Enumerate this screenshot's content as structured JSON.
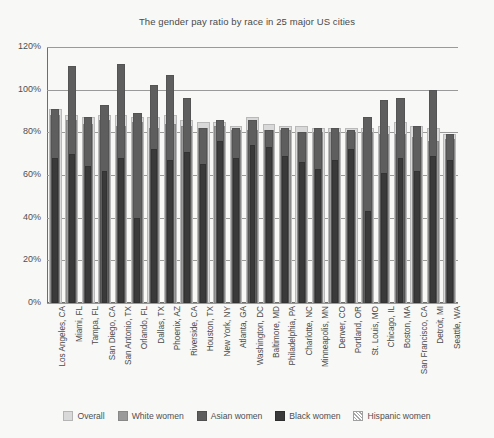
{
  "chart_data": {
    "type": "bar",
    "title": "The gender pay ratio by race in 25 major US cities",
    "xlabel": "",
    "ylabel": "",
    "ylim": [
      0,
      120
    ],
    "ytick_labels": [
      "0%",
      "20%",
      "40%",
      "60%",
      "80%",
      "100%",
      "120%"
    ],
    "ytick_values": [
      0,
      20,
      40,
      60,
      80,
      100,
      120
    ],
    "grid": true,
    "legend_position": "bottom",
    "bar_mode": "overlay",
    "categories": [
      "Los Angeles, CA",
      "Miami, FL",
      "Tampa, FL",
      "San Diego, CA",
      "San Antonio, TX",
      "Orlando, FL",
      "Dallas, TX",
      "Phoenix, AZ",
      "Riverside, CA",
      "Houston, TX",
      "New York, NY",
      "Atlanta, GA",
      "Washington, DC",
      "Baltimore, MD",
      "Philadelphia, PA",
      "Charlotte, NC",
      "Minneapolis, MN",
      "Denver, CO",
      "Portland, OR",
      "St. Louis, MO",
      "Chicago, IL",
      "Boston, MA",
      "San Francisco, CA",
      "Detroit, MI",
      "Seattle, WA"
    ],
    "series": [
      {
        "name": "Overall",
        "color": "#d9d9d9",
        "values": [
          91,
          88,
          87,
          88,
          88,
          87,
          87,
          88,
          86,
          85,
          85,
          83,
          87,
          84,
          83,
          83,
          82,
          82,
          82,
          82,
          83,
          85,
          83,
          82,
          79
        ]
      },
      {
        "name": "White women",
        "color": "#9a9a9a",
        "values": [
          88,
          86,
          84,
          86,
          83,
          85,
          82,
          84,
          83,
          82,
          83,
          81,
          81,
          81,
          81,
          80,
          80,
          80,
          80,
          80,
          79,
          79,
          78,
          76,
          77
        ]
      },
      {
        "name": "Asian women",
        "color": "#5e5e5e",
        "values": [
          91,
          111,
          87,
          93,
          112,
          89,
          102,
          107,
          96,
          82,
          86,
          82,
          86,
          81,
          82,
          80,
          82,
          82,
          81,
          87,
          95,
          96,
          83,
          100,
          79
        ]
      },
      {
        "name": "Black women",
        "color": "#3a3a3a",
        "values": [
          68,
          70,
          64,
          62,
          68,
          40,
          72,
          67,
          71,
          65,
          76,
          68,
          74,
          73,
          69,
          66,
          63,
          67,
          72,
          43,
          61,
          68,
          62,
          69,
          67
        ]
      },
      {
        "name": "Hispanic women",
        "color": "#ffffff",
        "hatch": true,
        "values": [
          55,
          59,
          54,
          57,
          58,
          59,
          59,
          57,
          53,
          56,
          57,
          58,
          57,
          58,
          57,
          58,
          57,
          57,
          57,
          57,
          51,
          53,
          50,
          54,
          54
        ]
      }
    ]
  },
  "legend": {
    "items": [
      {
        "label": "Overall"
      },
      {
        "label": "White women"
      },
      {
        "label": "Asian women"
      },
      {
        "label": "Black women"
      },
      {
        "label": "Hispanic women"
      }
    ]
  }
}
